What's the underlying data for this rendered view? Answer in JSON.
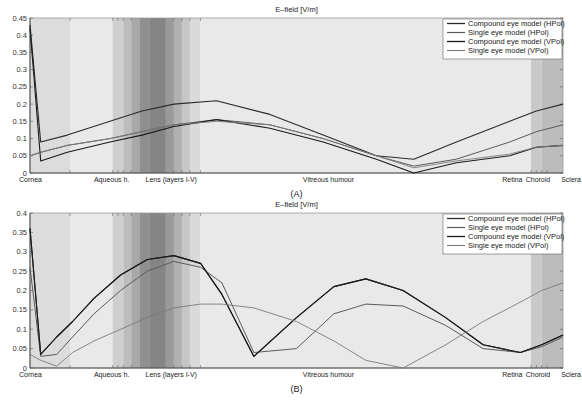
{
  "chart_data": [
    {
      "type": "line",
      "panel_label": "(A)",
      "title": "E–field [V/m]",
      "xlabel": "",
      "ylabel": "",
      "ylim": [
        0,
        0.45
      ],
      "yticks": [
        "0",
        "0.05",
        "0.1",
        "0.15",
        "0.2",
        "0.25",
        "0.3",
        "0.35",
        "0.4",
        "0.45"
      ],
      "region_labels": [
        "Cornea",
        "Aqueous h.",
        "Lens (layers I-V)",
        "Vitreous humour",
        "Retina",
        "Choroid",
        "Sclera"
      ],
      "legend": [
        "Compound eye model (HPol)",
        "Single eye model (HPol)",
        "Compound eye model (VPol)",
        "Single eye model (VPol)"
      ],
      "legend_position": "upper right",
      "x": [
        0,
        0.02,
        0.07,
        0.15,
        0.21,
        0.27,
        0.35,
        0.45,
        0.55,
        0.65,
        0.72,
        0.8,
        0.9,
        0.95,
        1.0
      ],
      "series": [
        {
          "name": "Compound eye model (HPol)",
          "values": [
            0.43,
            0.09,
            0.11,
            0.15,
            0.18,
            0.2,
            0.21,
            0.17,
            0.11,
            0.05,
            0.04,
            0.09,
            0.15,
            0.18,
            0.2
          ]
        },
        {
          "name": "Single eye model (HPol)",
          "values": [
            0.05,
            0.06,
            0.08,
            0.1,
            0.12,
            0.14,
            0.155,
            0.14,
            0.1,
            0.05,
            0.02,
            0.04,
            0.09,
            0.12,
            0.14
          ]
        },
        {
          "name": "Compound eye model (VPol)",
          "values": [
            0.42,
            0.035,
            0.06,
            0.09,
            0.11,
            0.135,
            0.155,
            0.13,
            0.09,
            0.04,
            0.0,
            0.03,
            0.05,
            0.075,
            0.08
          ]
        },
        {
          "name": "Single eye model (VPol)",
          "values": [
            0.05,
            0.06,
            0.08,
            0.1,
            0.12,
            0.14,
            0.15,
            0.14,
            0.1,
            0.05,
            0.015,
            0.035,
            0.055,
            0.075,
            0.08
          ]
        }
      ]
    },
    {
      "type": "line",
      "panel_label": "(B)",
      "title": "E–field [V/m]",
      "xlabel": "",
      "ylabel": "",
      "ylim": [
        0,
        0.4
      ],
      "yticks": [
        "0",
        "0.05",
        "0.1",
        "0.15",
        "0.2",
        "0.25",
        "0.3",
        "0.35",
        "0.4"
      ],
      "region_labels": [
        "Cornea",
        "Aqueous h.",
        "Lens (layers I-V)",
        "Vitreous humour",
        "Retina",
        "Choroid",
        "Sclera"
      ],
      "legend": [
        "Compound eye model (HPol)",
        "Single eye model (HPol)",
        "Compound eye model (VPol)",
        "Single eye model (VPol)"
      ],
      "legend_position": "upper right",
      "x": [
        0,
        0.02,
        0.05,
        0.08,
        0.12,
        0.17,
        0.22,
        0.27,
        0.32,
        0.36,
        0.42,
        0.5,
        0.57,
        0.63,
        0.7,
        0.78,
        0.85,
        0.92,
        0.96,
        1.0
      ],
      "series": [
        {
          "name": "Compound eye model (HPol)",
          "values": [
            0.36,
            0.035,
            0.08,
            0.12,
            0.18,
            0.24,
            0.28,
            0.29,
            0.27,
            0.19,
            0.03,
            0.13,
            0.21,
            0.23,
            0.2,
            0.13,
            0.06,
            0.04,
            0.06,
            0.085
          ]
        },
        {
          "name": "Single eye model (HPol)",
          "values": [
            0.26,
            0.03,
            0.035,
            0.08,
            0.14,
            0.2,
            0.25,
            0.275,
            0.26,
            0.22,
            0.04,
            0.05,
            0.14,
            0.165,
            0.16,
            0.11,
            0.05,
            0.04,
            0.055,
            0.08
          ]
        },
        {
          "name": "Compound eye model (VPol)",
          "values": [
            0.36,
            0.035,
            0.08,
            0.12,
            0.18,
            0.24,
            0.28,
            0.29,
            0.27,
            0.19,
            0.03,
            0.13,
            0.21,
            0.23,
            0.2,
            0.13,
            0.06,
            0.04,
            0.06,
            0.085
          ]
        },
        {
          "name": "Single eye model (VPol)",
          "values": [
            0.035,
            0.02,
            0.005,
            0.04,
            0.07,
            0.1,
            0.13,
            0.155,
            0.165,
            0.165,
            0.155,
            0.12,
            0.07,
            0.02,
            0.0,
            0.06,
            0.12,
            0.17,
            0.2,
            0.22
          ]
        }
      ]
    }
  ]
}
